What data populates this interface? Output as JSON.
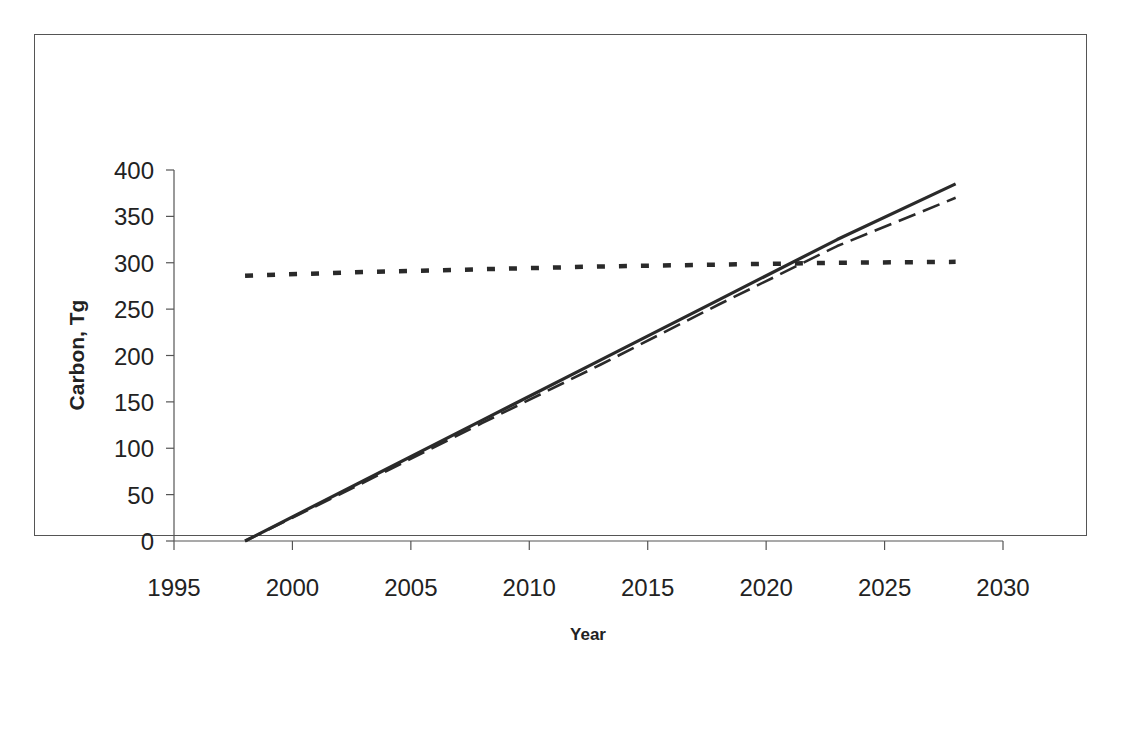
{
  "chart_data": {
    "type": "line",
    "title": "",
    "xlabel": "Year",
    "ylabel": "Carbon, Tg",
    "xlim": [
      1995,
      2030
    ],
    "ylim": [
      0,
      400
    ],
    "x_ticks": [
      "1995",
      "2000",
      "2005",
      "2010",
      "2015",
      "2020",
      "2025",
      "2030"
    ],
    "y_ticks": [
      "0",
      "50",
      "100",
      "150",
      "200",
      "250",
      "300",
      "350",
      "400"
    ],
    "grid": false,
    "legend": null,
    "series": [
      {
        "name": "solid",
        "style": "solid",
        "x": [
          1998,
          2003,
          2008,
          2013,
          2018,
          2023,
          2028
        ],
        "values": [
          0,
          65,
          130,
          195,
          260,
          325,
          385
        ]
      },
      {
        "name": "dashed",
        "style": "dashed",
        "x": [
          1998,
          2003,
          2008,
          2013,
          2018,
          2023,
          2028
        ],
        "values": [
          0,
          63,
          127,
          190,
          255,
          318,
          370
        ]
      },
      {
        "name": "dotted",
        "style": "dotted",
        "x": [
          1998,
          2003,
          2008,
          2013,
          2018,
          2023,
          2028
        ],
        "values": [
          286,
          290,
          293,
          296,
          298,
          300,
          301
        ]
      }
    ]
  }
}
